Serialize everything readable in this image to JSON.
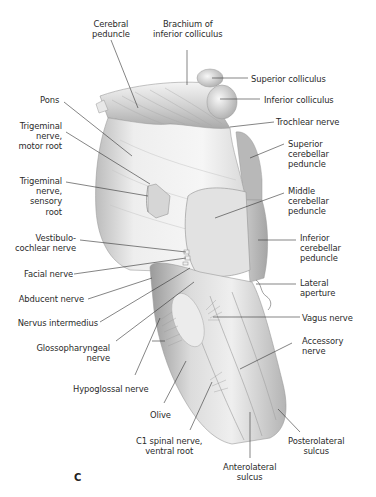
{
  "figure": {
    "panel_letter": "C",
    "colors": {
      "background": "#ffffff",
      "tissue_light": "#f2f2f2",
      "tissue_mid": "#cfcfcf",
      "tissue_dark": "#8f8f8f",
      "leader": "#333333",
      "text": "#2a2a2a"
    },
    "labels": {
      "cerebral_peduncle": "Cerebral\npeduncle",
      "brachium_inferior_colliculus": "Brachium of\ninferior colliculus",
      "superior_colliculus": "Superior colliculus",
      "inferior_colliculus": "Inferior colliculus",
      "pons": "Pons",
      "trochlear_nerve": "Trochlear nerve",
      "trigeminal_motor_root": "Trigeminal\nnerve,\nmotor root",
      "superior_cerebellar_peduncle": "Superior\ncerebellar\npeduncle",
      "trigeminal_sensory_root": "Trigeminal\nnerve,\nsensory\nroot",
      "middle_cerebellar_peduncle": "Middle\ncerebellar\npeduncle",
      "vestibulocochlear_nerve": "Vestibulo-\ncochlear nerve",
      "inferior_cerebellar_peduncle": "Inferior\ncerebellar\npeduncle",
      "facial_nerve": "Facial nerve",
      "abducent_nerve": "Abducent nerve",
      "lateral_aperture": "Lateral\naperture",
      "nervus_intermedius": "Nervus intermedius",
      "vagus_nerve": "Vagus nerve",
      "glossopharyngeal_nerve": "Glossopharyngeal\nnerve",
      "accessory_nerve": "Accessory\nnerve",
      "hypoglossal_nerve": "Hypoglossal nerve",
      "olive": "Olive",
      "c1_spinal_nerve": "C1 spinal nerve,\nventral root",
      "posterolateral_sulcus": "Posterolateral\nsulcus",
      "anterolateral_sulcus": "Anterolateral\nsulcus"
    }
  }
}
